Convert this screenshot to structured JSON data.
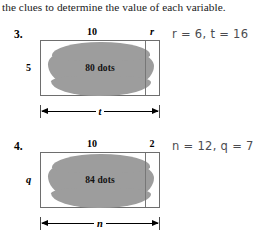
{
  "instruction": "the clues to determine the value of each variable.",
  "problems": [
    {
      "number": "3.",
      "top_left_label": "10",
      "top_right_label": "r",
      "side_label": "5",
      "blob_label": "80 dots",
      "bottom_label": "t",
      "answer": "r = 6, t = 16"
    },
    {
      "number": "4.",
      "top_left_label": "10",
      "top_right_label": "2",
      "side_label": "q",
      "blob_label": "84 dots",
      "bottom_label": "n",
      "answer": "n = 12, q = 7"
    }
  ],
  "colors": {
    "blob_fill": "#9d9d9d",
    "rect_border": "#6e6e6e",
    "answer_ink": "#3c3c42"
  }
}
